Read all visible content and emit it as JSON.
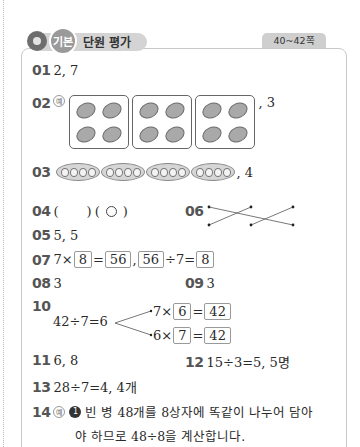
{
  "header": {
    "badge": "기본",
    "title": "단원 평가",
    "page_range": "40~42쪽"
  },
  "answers": {
    "q01": {
      "num": "01",
      "text": "2, 7"
    },
    "q02": {
      "num": "02",
      "example": "예",
      "groups": 3,
      "items_per_group": 4,
      "suffix": ", 3"
    },
    "q03": {
      "num": "03",
      "pods": 4,
      "peas_per_pod": 4,
      "suffix": ", 4"
    },
    "q04": {
      "num": "04",
      "open1": "(",
      "close1": ")",
      "open2": "(",
      "close2": ")"
    },
    "q05": {
      "num": "05",
      "text": "5, 5"
    },
    "q06": {
      "num": "06"
    },
    "q07": {
      "num": "07",
      "a": "7",
      "times": "×",
      "b": "8",
      "eq": "=",
      "c": "56",
      "comma": ",",
      "d": "56",
      "div": "÷",
      "e": "7",
      "eq2": "=",
      "f": "8"
    },
    "q08": {
      "num": "08",
      "text": "3"
    },
    "q09": {
      "num": "09",
      "text": "3"
    },
    "q10": {
      "num": "10",
      "stem": "42÷7=6",
      "line1_a": "7×",
      "line1_b": "6",
      "line1_eq": "=",
      "line1_c": "42",
      "line2_a": "6×",
      "line2_b": "7",
      "line2_eq": "=",
      "line2_c": "42"
    },
    "q11": {
      "num": "11",
      "text": "6, 8"
    },
    "q12": {
      "num": "12",
      "text": "15÷3=5, 5명"
    },
    "q13": {
      "num": "13",
      "text": "28÷7=4, 4개"
    },
    "q14": {
      "num": "14",
      "example": "예",
      "bullet": "1",
      "line1": "빈 병 48개를 8상자에 똑같이 나누어 담아",
      "line2": "야 하므로 48÷8을 계산합니다."
    }
  }
}
